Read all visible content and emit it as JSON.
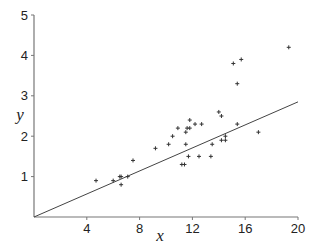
{
  "chart_data": {
    "type": "scatter",
    "title": "",
    "xlabel": "x",
    "ylabel": "y",
    "xlim": [
      0,
      20
    ],
    "ylim": [
      0,
      5
    ],
    "xticks": [
      4,
      8,
      12,
      16,
      20
    ],
    "yticks": [
      1,
      2,
      3,
      4,
      5
    ],
    "grid": false,
    "legend": null,
    "marker": "+",
    "series": [
      {
        "name": "observations",
        "points": [
          [
            4.7,
            0.9
          ],
          [
            6.0,
            0.9
          ],
          [
            6.5,
            1.0
          ],
          [
            6.6,
            1.0
          ],
          [
            6.6,
            0.8
          ],
          [
            7.1,
            1.0
          ],
          [
            7.5,
            1.4
          ],
          [
            9.2,
            1.7
          ],
          [
            10.2,
            1.8
          ],
          [
            10.5,
            2.0
          ],
          [
            10.9,
            2.2
          ],
          [
            11.2,
            1.3
          ],
          [
            11.4,
            1.3
          ],
          [
            11.5,
            1.8
          ],
          [
            11.5,
            2.1
          ],
          [
            11.6,
            2.2
          ],
          [
            11.7,
            1.5
          ],
          [
            11.8,
            2.2
          ],
          [
            11.8,
            2.4
          ],
          [
            12.2,
            2.3
          ],
          [
            12.5,
            1.5
          ],
          [
            12.7,
            2.3
          ],
          [
            13.4,
            1.5
          ],
          [
            13.5,
            1.8
          ],
          [
            14.0,
            2.6
          ],
          [
            14.2,
            1.9
          ],
          [
            14.2,
            2.5
          ],
          [
            14.5,
            1.9
          ],
          [
            14.5,
            2.0
          ],
          [
            15.1,
            3.8
          ],
          [
            15.4,
            3.3
          ],
          [
            15.4,
            2.3
          ],
          [
            15.7,
            3.9
          ],
          [
            17.0,
            2.1
          ],
          [
            19.3,
            4.2
          ]
        ]
      }
    ],
    "fit_line": {
      "name": "regression through origin",
      "from": [
        0,
        0
      ],
      "to": [
        20,
        2.85
      ],
      "slope": 0.1425
    }
  },
  "labels": {
    "x": "x",
    "y": "y",
    "xticks": [
      "4",
      "8",
      "12",
      "16",
      "20"
    ],
    "yticks": [
      "1",
      "2",
      "3",
      "4",
      "5"
    ]
  }
}
